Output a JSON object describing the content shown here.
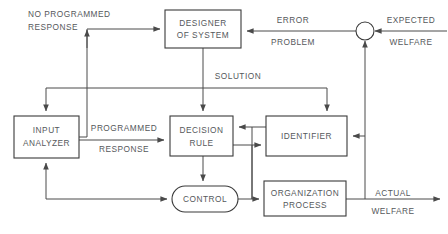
{
  "diagram": {
    "colors": {
      "background": "#ffffff",
      "stroke": "#3a3a3a",
      "edge": "#4a4a4a",
      "text": "#55585b"
    },
    "nodes": [
      {
        "id": "designer-of-system",
        "shape": "rect",
        "line1": "DESIGNER",
        "line2": "OF  SYSTEM",
        "x": 165,
        "y": 10,
        "w": 76,
        "h": 38
      },
      {
        "id": "input-analyzer",
        "shape": "rect",
        "line1": "INPUT",
        "line2": "ANALYZER",
        "x": 14,
        "y": 116,
        "w": 65,
        "h": 42
      },
      {
        "id": "decision-rule",
        "shape": "rect",
        "line1": "DECISION",
        "line2": "RULE",
        "x": 170,
        "y": 116,
        "w": 63,
        "h": 40
      },
      {
        "id": "identifier",
        "shape": "rect",
        "line1": "IDENTIFIER",
        "line2": "",
        "x": 266,
        "y": 116,
        "w": 81,
        "h": 40
      },
      {
        "id": "control",
        "shape": "stadium",
        "line1": "CONTROL",
        "line2": "",
        "x": 172,
        "y": 186,
        "w": 66,
        "h": 26
      },
      {
        "id": "organization-process",
        "shape": "rect",
        "line1": "ORGANIZATION",
        "line2": "PROCESS",
        "x": 264,
        "y": 181,
        "w": 82,
        "h": 35
      },
      {
        "id": "summing-junction",
        "shape": "circle",
        "line1": "",
        "line2": "",
        "cx": 365,
        "cy": 31,
        "r": 9
      }
    ],
    "edge_labels": [
      {
        "id": "no-programmed-response",
        "line1": "NO  PROGRAMMED",
        "line2": "RESPONSE",
        "x1": 28,
        "y1": 16,
        "x2": 28,
        "y2": 30,
        "align": "start"
      },
      {
        "id": "error-problem",
        "line1": "ERROR",
        "line2": "PROBLEM",
        "x1": 291,
        "y1": 22,
        "x2": 291,
        "y2": 44,
        "align": "middle"
      },
      {
        "id": "expected-welfare",
        "line1": "EXPECTED",
        "line2": "WELFARE",
        "x1": 411,
        "y1": 22,
        "x2": 411,
        "y2": 44,
        "align": "middle"
      },
      {
        "id": "solution",
        "line1": "SOLUTION",
        "line2": "",
        "x1": 238,
        "y1": 78,
        "x2": 0,
        "y2": 0,
        "align": "middle"
      },
      {
        "id": "programmed-response",
        "line1": "PROGRAMMED",
        "line2": "RESPONSE",
        "x1": 124,
        "y1": 128,
        "x2": 124,
        "y2": 150,
        "align": "middle"
      },
      {
        "id": "actual-welfare",
        "line1": "ACTUAL",
        "line2": "WELFARE",
        "x1": 393,
        "y1": 196,
        "x2": 393,
        "y2": 215,
        "align": "middle"
      }
    ]
  }
}
